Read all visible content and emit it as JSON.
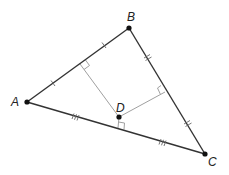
{
  "diagram": {
    "type": "geometry",
    "colors": {
      "side": "#333333",
      "perpendicular": "#999999",
      "point": "#111111",
      "label": "#222222"
    },
    "points": {
      "A": {
        "label": "A",
        "x": 27,
        "y": 102
      },
      "B": {
        "label": "B",
        "x": 129,
        "y": 28
      },
      "C": {
        "label": "C",
        "x": 205,
        "y": 154
      },
      "D": {
        "label": "D",
        "x": 119,
        "y": 117
      }
    },
    "sides": [
      {
        "name": "AB",
        "ticks": 1
      },
      {
        "name": "BC",
        "ticks": 2
      },
      {
        "name": "AC",
        "ticks": 3
      }
    ],
    "perpendiculars": [
      {
        "from": "D",
        "to_side": "AB",
        "right_angle_marker": true
      },
      {
        "from": "D",
        "to_side": "BC",
        "right_angle_marker": true
      },
      {
        "from": "D",
        "to_side": "AC",
        "right_angle_marker": true
      }
    ]
  }
}
